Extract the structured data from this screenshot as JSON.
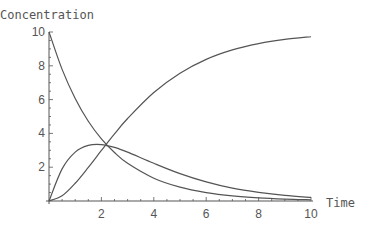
{
  "chart_data": {
    "type": "line",
    "title": "",
    "xlabel": "Time",
    "ylabel": "Concentration",
    "xlim": [
      0,
      10
    ],
    "ylim": [
      0,
      10
    ],
    "grid": false,
    "legend": null,
    "x_ticks": [
      "2",
      "4",
      "6",
      "8",
      "10"
    ],
    "y_ticks": [
      "2",
      "4",
      "6",
      "8",
      "10"
    ],
    "x": [
      0,
      0.5,
      1,
      1.5,
      2,
      2.5,
      3,
      4,
      5,
      6,
      7,
      8,
      9,
      10
    ],
    "series": [
      {
        "name": "A (decaying)",
        "values": [
          10,
          7.79,
          6.07,
          4.72,
          3.68,
          2.87,
          2.23,
          1.35,
          0.82,
          0.5,
          0.3,
          0.18,
          0.11,
          0.07
        ]
      },
      {
        "name": "B (intermediate)",
        "values": [
          0,
          1.9,
          2.89,
          3.29,
          3.34,
          3.17,
          2.89,
          2.23,
          1.62,
          1.13,
          0.76,
          0.51,
          0.33,
          0.21
        ]
      },
      {
        "name": "C (product)",
        "values": [
          0,
          0.31,
          1.05,
          1.99,
          2.99,
          3.97,
          4.88,
          6.42,
          7.56,
          8.38,
          8.94,
          9.31,
          9.56,
          9.72
        ]
      }
    ],
    "line_color": "#555555"
  }
}
